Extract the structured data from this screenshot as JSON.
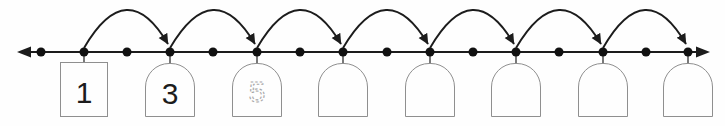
{
  "worksheet": {
    "background": "#fefefe",
    "colors": {
      "ink": "#1c1c1c",
      "dot": "#111111",
      "box_border": "#8f8f8f",
      "traced_digit": "#a6a6a6",
      "connector": "#3f3f3f"
    },
    "number_line": {
      "y": 52,
      "x_start": 17,
      "x_end": 710,
      "dot_xs": [
        41,
        84,
        127,
        170,
        213,
        257,
        300,
        343,
        387,
        430,
        473,
        516,
        559,
        603,
        646,
        688
      ],
      "labeled_dot_indices": [
        1,
        3,
        5,
        7,
        9,
        11,
        13,
        15
      ],
      "arc_peak_y": 10,
      "jump_count": 7
    },
    "boxes": [
      {
        "value": "1",
        "shape": "square",
        "text_style": "printed"
      },
      {
        "value": "3",
        "shape": "arch",
        "text_style": "printed"
      },
      {
        "value": "5",
        "shape": "arch",
        "text_style": "traced"
      },
      {
        "value": "",
        "shape": "arch",
        "text_style": "empty"
      },
      {
        "value": "",
        "shape": "arch",
        "text_style": "empty"
      },
      {
        "value": "",
        "shape": "arch",
        "text_style": "empty"
      },
      {
        "value": "",
        "shape": "arch",
        "text_style": "empty"
      },
      {
        "value": "",
        "shape": "arch",
        "text_style": "empty"
      }
    ]
  }
}
